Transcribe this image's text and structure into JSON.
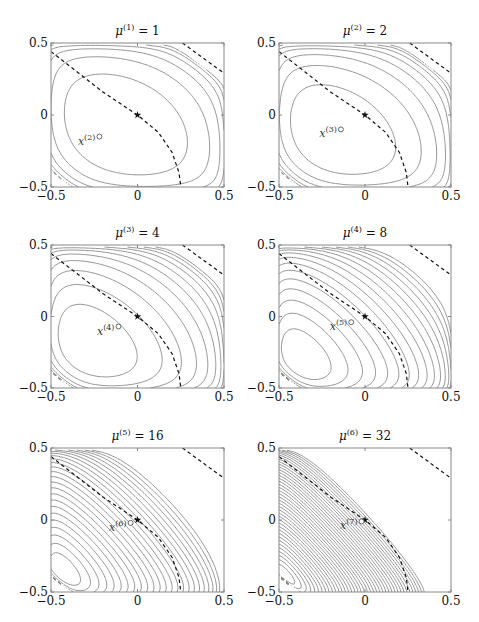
{
  "figure": {
    "layout": {
      "rows": 3,
      "cols": 2
    },
    "colors": {
      "contour": "#8a8a8a",
      "frame": "#888888",
      "central_path": "#111111",
      "text": "#111111"
    }
  },
  "chart_data": [
    {
      "type": "contour",
      "title": "μ(1) = 1",
      "mu_index": "1",
      "mu": 1,
      "xlim": [
        -0.5,
        0.5
      ],
      "ylim": [
        -0.5,
        0.5
      ],
      "xticks": [
        "−0.5",
        "0",
        "0.5"
      ],
      "yticks": [
        "−0.5",
        "0",
        "0.5"
      ],
      "optimum_marker": {
        "symbol": "star",
        "x": 0,
        "y": 0
      },
      "iterate_marker": {
        "label": "x(2)",
        "sup": "(2)",
        "symbol": "circle",
        "x": -0.22,
        "y": -0.15
      },
      "central_path": "dashed",
      "contour_count": 6
    },
    {
      "type": "contour",
      "title": "μ(2) = 2",
      "mu_index": "2",
      "mu": 2,
      "xlim": [
        -0.5,
        0.5
      ],
      "ylim": [
        -0.5,
        0.5
      ],
      "xticks": [
        "−0.5",
        "0",
        "0.5"
      ],
      "yticks": [
        "−0.5",
        "0",
        "0.5"
      ],
      "optimum_marker": {
        "symbol": "star",
        "x": 0,
        "y": 0
      },
      "iterate_marker": {
        "label": "x(3)",
        "sup": "(3)",
        "symbol": "circle",
        "x": -0.14,
        "y": -0.1
      },
      "central_path": "dashed",
      "contour_count": 8
    },
    {
      "type": "contour",
      "title": "μ(3) = 4",
      "mu_index": "3",
      "mu": 4,
      "xlim": [
        -0.5,
        0.5
      ],
      "ylim": [
        -0.5,
        0.5
      ],
      "xticks": [
        "−0.5",
        "0",
        "0.5"
      ],
      "yticks": [
        "−0.5",
        "0",
        "0.5"
      ],
      "optimum_marker": {
        "symbol": "star",
        "x": 0,
        "y": 0
      },
      "iterate_marker": {
        "label": "x(4)",
        "sup": "(4)",
        "symbol": "circle",
        "x": -0.11,
        "y": -0.07
      },
      "central_path": "dashed",
      "contour_count": 11
    },
    {
      "type": "contour",
      "title": "μ(4) = 8",
      "mu_index": "4",
      "mu": 8,
      "xlim": [
        -0.5,
        0.5
      ],
      "ylim": [
        -0.5,
        0.5
      ],
      "xticks": [
        "−0.5",
        "0",
        "0.5"
      ],
      "yticks": [
        "−0.5",
        "0",
        "0.5"
      ],
      "optimum_marker": {
        "symbol": "star",
        "x": 0,
        "y": 0
      },
      "iterate_marker": {
        "label": "x(5)",
        "sup": "(5)",
        "symbol": "circle",
        "x": -0.08,
        "y": -0.04
      },
      "central_path": "dashed",
      "contour_count": 16
    },
    {
      "type": "contour",
      "title": "μ(5) = 16",
      "mu_index": "5",
      "mu": 16,
      "xlim": [
        -0.5,
        0.5
      ],
      "ylim": [
        -0.5,
        0.5
      ],
      "xticks": [
        "−0.5",
        "0",
        "0.5"
      ],
      "yticks": [
        "−0.5",
        "0",
        "0.5"
      ],
      "optimum_marker": {
        "symbol": "star",
        "x": 0,
        "y": 0
      },
      "iterate_marker": {
        "label": "x(6)",
        "sup": "(6)",
        "symbol": "circle",
        "x": -0.04,
        "y": -0.02
      },
      "central_path": "dashed",
      "contour_count": 24
    },
    {
      "type": "contour",
      "title": "μ(6) = 32",
      "mu_index": "6",
      "mu": 32,
      "xlim": [
        -0.5,
        0.5
      ],
      "ylim": [
        -0.5,
        0.5
      ],
      "xticks": [
        "−0.5",
        "0",
        "0.5"
      ],
      "yticks": [
        "−0.5",
        "0",
        "0.5"
      ],
      "optimum_marker": {
        "symbol": "star",
        "x": 0,
        "y": 0
      },
      "iterate_marker": {
        "label": "x(7)",
        "sup": "(7)",
        "symbol": "circle",
        "x": -0.02,
        "y": -0.01
      },
      "central_path": "dashed",
      "contour_count": 40
    }
  ],
  "panels": [
    {
      "title_mu": "μ",
      "title_sup": "(1)",
      "title_rhs": "= 1",
      "iter_x": "x",
      "iter_sup": "(2)",
      "x_tick_labels": [
        "−0.5",
        "0",
        "0.5"
      ],
      "y_tick_labels": [
        "0.5",
        "0",
        "−0.5"
      ]
    },
    {
      "title_mu": "μ",
      "title_sup": "(2)",
      "title_rhs": "= 2",
      "iter_x": "x",
      "iter_sup": "(3)",
      "x_tick_labels": [
        "−0.5",
        "0",
        "0.5"
      ],
      "y_tick_labels": [
        "0.5",
        "0",
        "−0.5"
      ]
    },
    {
      "title_mu": "μ",
      "title_sup": "(3)",
      "title_rhs": "= 4",
      "iter_x": "x",
      "iter_sup": "(4)",
      "x_tick_labels": [
        "−0.5",
        "0",
        "0.5"
      ],
      "y_tick_labels": [
        "0.5",
        "0",
        "−0.5"
      ]
    },
    {
      "title_mu": "μ",
      "title_sup": "(4)",
      "title_rhs": "= 8",
      "iter_x": "x",
      "iter_sup": "(5)",
      "x_tick_labels": [
        "−0.5",
        "0",
        "0.5"
      ],
      "y_tick_labels": [
        "0.5",
        "0",
        "−0.5"
      ]
    },
    {
      "title_mu": "μ",
      "title_sup": "(5)",
      "title_rhs": "= 16",
      "iter_x": "x",
      "iter_sup": "(6)",
      "x_tick_labels": [
        "−0.5",
        "0",
        "0.5"
      ],
      "y_tick_labels": [
        "0.5",
        "0",
        "−0.5"
      ]
    },
    {
      "title_mu": "μ",
      "title_sup": "(6)",
      "title_rhs": "= 32",
      "iter_x": "x",
      "iter_sup": "(7)",
      "x_tick_labels": [
        "−0.5",
        "0",
        "0.5"
      ],
      "y_tick_labels": [
        "0.5",
        "0",
        "−0.5"
      ]
    }
  ]
}
